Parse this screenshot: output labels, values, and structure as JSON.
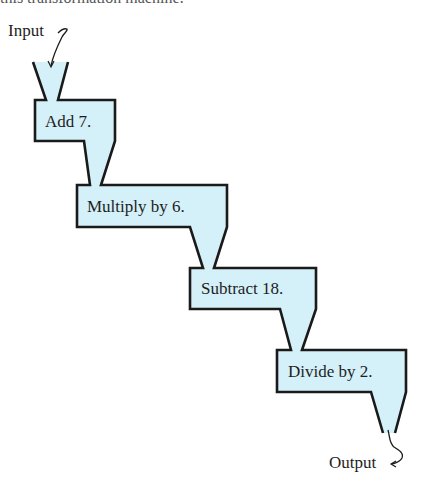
{
  "caption_cut": "this transformation machine:",
  "input_label": "Input",
  "output_label": "Output",
  "steps": [
    {
      "label": "Add 7."
    },
    {
      "label": "Multiply by 6."
    },
    {
      "label": "Subtract 18."
    },
    {
      "label": "Divide by 2."
    }
  ],
  "colors": {
    "fill": "#d4f0f8",
    "stroke": "#1a1a1a"
  }
}
